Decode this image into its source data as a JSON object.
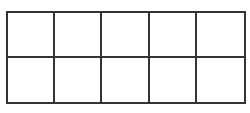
{
  "diagram": {
    "type": "grid",
    "rows": 2,
    "columns": 5,
    "line_color": "#333333",
    "fill_color": "#ffffff",
    "cells": [
      {
        "row": 1,
        "col": 1,
        "label": ""
      },
      {
        "row": 1,
        "col": 2,
        "label": ""
      },
      {
        "row": 1,
        "col": 3,
        "label": ""
      },
      {
        "row": 1,
        "col": 4,
        "label": ""
      },
      {
        "row": 1,
        "col": 5,
        "label": ""
      },
      {
        "row": 2,
        "col": 1,
        "label": ""
      },
      {
        "row": 2,
        "col": 2,
        "label": ""
      },
      {
        "row": 2,
        "col": 3,
        "label": ""
      },
      {
        "row": 2,
        "col": 4,
        "label": ""
      },
      {
        "row": 2,
        "col": 5,
        "label": ""
      }
    ]
  }
}
